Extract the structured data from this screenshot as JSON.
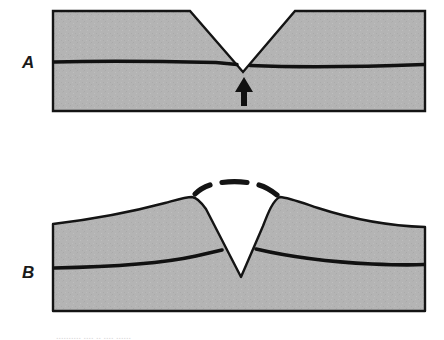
{
  "figure": {
    "type": "geologic-cross-section",
    "panels": [
      {
        "id": "A",
        "label": "A",
        "description": "Flat-topped crustal block cut by a V-shaped valley, with an upward arrow beneath the valley indicating uplift",
        "block": {
          "left": 52,
          "right": 426,
          "top": 11,
          "bottom": 312,
          "surface_top_y": 11,
          "base_y": 112
        },
        "valley": {
          "left_rim_x": 190,
          "right_rim_x": 295,
          "vertex_x": 243,
          "vertex_y": 72
        },
        "strata_line_y_left": 62,
        "strata_line_y_right": 66,
        "arrow": {
          "name": "uplift-arrow",
          "direction": "up",
          "x": 244,
          "tail_y": 105,
          "head_y": 78
        }
      },
      {
        "id": "B",
        "label": "B",
        "description": "Same block after doming and uplift; flanks arch upward, the valley has deepened, and a dashed arc marks the eroded former land surface",
        "block": {
          "left": 52,
          "right": 426,
          "top": 197,
          "bottom": 312,
          "left_edge_top_y": 224,
          "right_edge_top_y": 227
        },
        "valley": {
          "left_rim_x": 192,
          "left_rim_y": 197,
          "right_rim_x": 280,
          "right_rim_y": 197,
          "vertex_x": 241,
          "vertex_y": 277
        },
        "strata_line_y_left": 268,
        "strata_line_y_right": 264,
        "eroded_surface": {
          "name": "dashed-eroded-surface-arc",
          "style": "dashed",
          "dash_count": 4,
          "apex_x": 238,
          "apex_y": 183
        }
      }
    ],
    "colors": {
      "rock_fill": "#b4b4b4",
      "outline": "#141414",
      "strata_line": "#111111",
      "arrow": "#111111",
      "dashed_arc": "#141414",
      "background": "#ffffff",
      "label_text": "#1a1a1a"
    },
    "caption_remnant": "..........  ....  ..  ....  ......"
  }
}
